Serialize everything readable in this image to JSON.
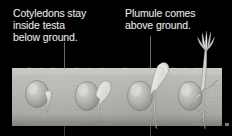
{
  "figure": {
    "background_color": "#000000",
    "text_color": "#e8e8e8",
    "soil_color": "#bdbdba",
    "seed_color": "#b9b9b4"
  },
  "captions": {
    "left": {
      "text": "Cotyledons stay\ninside testa\nbelow ground.",
      "lines": [
        "Cotyledons stay",
        "inside testa",
        "below ground."
      ]
    },
    "right": {
      "text": "Plumule comes\nabove ground.",
      "lines": [
        "Plumule comes",
        "above ground."
      ]
    }
  },
  "leaders": {
    "left_label": "leader line to stage two",
    "right_label": "leader line to stage three"
  },
  "soil": {
    "label": "ground / soil block"
  },
  "stages": [
    {
      "index": 1,
      "label": "Stage 1 - seed with emerging radicle"
    },
    {
      "index": 2,
      "label": "Stage 2 - hypocotyl hook forming below ground"
    },
    {
      "index": 3,
      "label": "Stage 3 - hook breaking through soil surface"
    },
    {
      "index": 4,
      "label": "Stage 4 - plumule and leaves above ground with root system"
    }
  ]
}
